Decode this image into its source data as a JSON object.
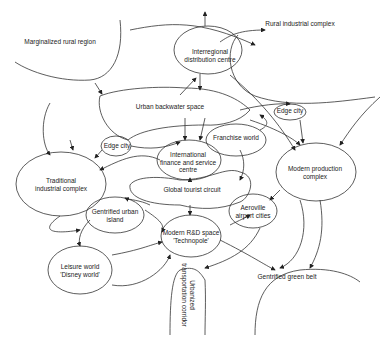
{
  "diagram": {
    "nodes": [
      {
        "id": "marginalized",
        "label": "Marginalized rural region",
        "x": 60,
        "y": 42
      },
      {
        "id": "rural_ind",
        "label": "Rural industrial complex",
        "x": 300,
        "y": 24
      },
      {
        "id": "interregional",
        "label": "Interregional\ndistribution centre",
        "x": 210,
        "y": 58
      },
      {
        "id": "backwater",
        "label": "Urban backwater space",
        "x": 170,
        "y": 107
      },
      {
        "id": "edge1",
        "label": "Edge city",
        "x": 290,
        "y": 111
      },
      {
        "id": "edge2",
        "label": "Edge city",
        "x": 117,
        "y": 146
      },
      {
        "id": "franchise",
        "label": "Franchise world",
        "x": 236,
        "y": 138
      },
      {
        "id": "intl",
        "label": "International\nfinance and service\ncentre",
        "x": 187,
        "y": 162
      },
      {
        "id": "traditional",
        "label": "Traditional\nindustrial complex",
        "x": 60,
        "y": 183
      },
      {
        "id": "modern_prod",
        "label": "Modern production\ncomplex",
        "x": 315,
        "y": 171
      },
      {
        "id": "tourist",
        "label": "Global tourist circuit",
        "x": 190,
        "y": 190
      },
      {
        "id": "gentrified_island",
        "label": "Gentrified urban\nisland",
        "x": 112,
        "y": 215
      },
      {
        "id": "aeroville",
        "label": "Aeroville\nairport cities",
        "x": 253,
        "y": 209
      },
      {
        "id": "technopole",
        "label": "Modern R&D space\n'Technopole'",
        "x": 190,
        "y": 236
      },
      {
        "id": "leisure",
        "label": "Leisure world\n'Disney world'",
        "x": 80,
        "y": 268
      },
      {
        "id": "green_belt",
        "label": "Gentrified green belt",
        "x": 283,
        "y": 277
      },
      {
        "id": "corridor",
        "label": "Urbanized\ntransportation corridor",
        "x": 190,
        "y": 292
      }
    ]
  }
}
